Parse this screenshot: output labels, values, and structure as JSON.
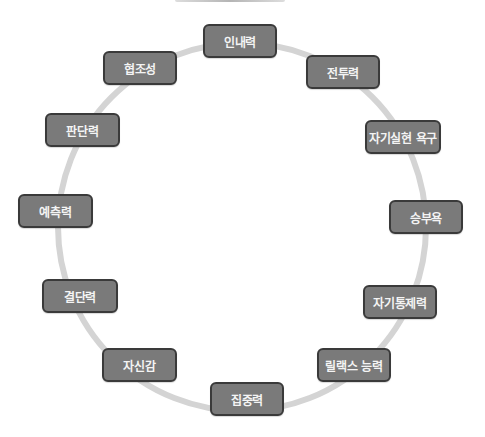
{
  "diagram": {
    "type": "cycle",
    "ring_color": "#d4d4d4",
    "node_fill": "#7a7a7a",
    "node_border": "#3a3a3a",
    "node_text_color": "#f4f4f4",
    "nodes": [
      {
        "label": "인내력",
        "x": 203,
        "y": 24,
        "w": 74
      },
      {
        "label": "전투력",
        "x": 306,
        "y": 55,
        "w": 74
      },
      {
        "label": "자기실현 욕구",
        "x": 365,
        "y": 120,
        "w": 76
      },
      {
        "label": "승부욕",
        "x": 389,
        "y": 200,
        "w": 74
      },
      {
        "label": "자기통제력",
        "x": 363,
        "y": 285,
        "w": 74
      },
      {
        "label": "릴랙스 능력",
        "x": 317,
        "y": 348,
        "w": 74
      },
      {
        "label": "집중력",
        "x": 210,
        "y": 382,
        "w": 74
      },
      {
        "label": "자신감",
        "x": 102,
        "y": 348,
        "w": 75
      },
      {
        "label": "결단력",
        "x": 42,
        "y": 279,
        "w": 76
      },
      {
        "label": "예측력",
        "x": 18,
        "y": 194,
        "w": 75
      },
      {
        "label": "판단력",
        "x": 45,
        "y": 113,
        "w": 75
      },
      {
        "label": "협조성",
        "x": 103,
        "y": 51,
        "w": 74
      }
    ]
  }
}
